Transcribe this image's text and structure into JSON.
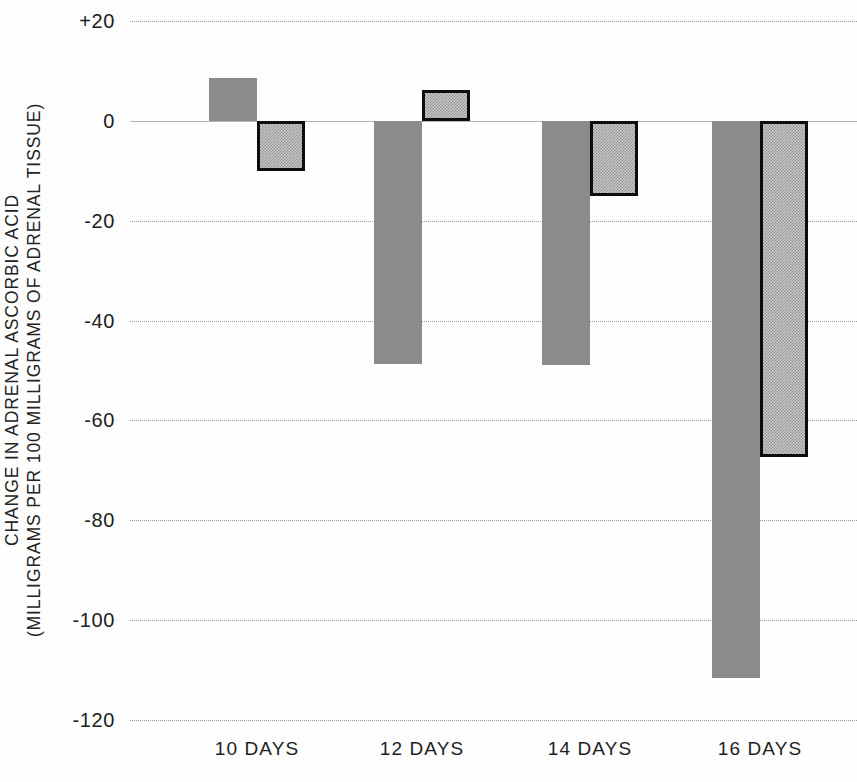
{
  "chart_data": {
    "type": "bar",
    "title": "",
    "subtitle": "",
    "xlabel": "",
    "ylabel": "CHANGE IN ADRENAL ASCORBIC ACID (MILLIGRAMS PER 100 MILLIGRAMS OF ADRENAL TISSUE)",
    "ylabel_lines": [
      "CHANGE IN ADRENAL ASCORBIC ACID",
      "(MILLIGRAMS PER 100 MILLIGRAMS OF ADRENAL TISSUE)"
    ],
    "categories": [
      "10 DAYS",
      "12 DAYS",
      "14 DAYS",
      "16 DAYS"
    ],
    "series": [
      {
        "name": "solid-gray-bar",
        "style": "solid gray fill",
        "color": "#8b8b8b",
        "values": [
          8.6,
          -48.7,
          -49.0,
          -111.5
        ]
      },
      {
        "name": "dotted-outlined-bar",
        "style": "checkered/dotted fill with black outline",
        "color": "#c9c9c9",
        "outline": "#0d0d0d",
        "values": [
          -10.0,
          6.2,
          -15.0,
          -67.3
        ]
      }
    ],
    "yticks": [
      "+20",
      "0",
      "-20",
      "-40",
      "-60",
      "-80",
      "-100",
      "-120"
    ],
    "ytick_values": [
      20,
      0,
      -20,
      -40,
      -60,
      -80,
      -100,
      -120
    ],
    "ylim": [
      -120,
      20
    ],
    "grid": true,
    "grid_style": "dotted horizontal",
    "legend": "none",
    "legend_position": "none",
    "zero_line": 0
  }
}
